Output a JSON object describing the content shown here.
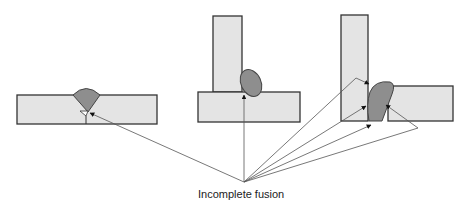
{
  "diagram": {
    "caption": "Incomplete fusion",
    "joints": [
      {
        "type": "butt-joint",
        "defect_locations": 1
      },
      {
        "type": "tee-joint",
        "defect_locations": 1
      },
      {
        "type": "corner-joint",
        "defect_locations": 4
      }
    ],
    "colors": {
      "plate_fill": "#e4e4e4",
      "weld_fill": "#8e8e8e",
      "outline": "#333333"
    }
  }
}
